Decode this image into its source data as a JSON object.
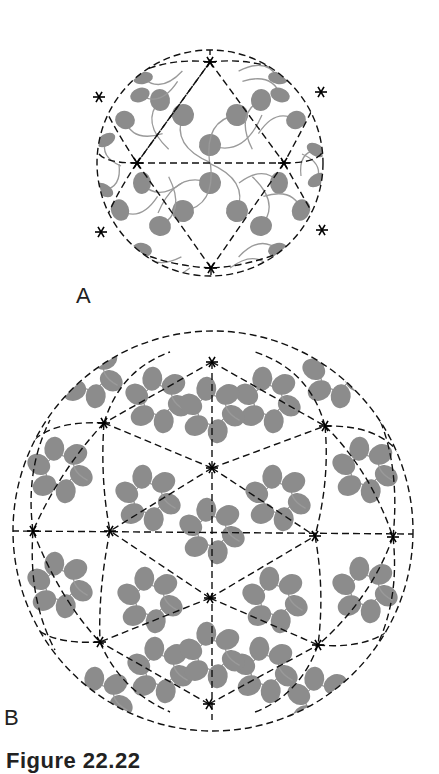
{
  "figure": {
    "panels": [
      {
        "label": "A",
        "description": "Icosahedral sphere (small) with dashed triangular lattice, vertices marked by black stars, gray subunits with curved tails",
        "center": [
          210,
          163
        ],
        "radius": 113
      },
      {
        "label": "B",
        "description": "Larger icosahedral sphere with denser triangular lattice, vertices marked by black stars, gray subunits with curved tails",
        "center": [
          213,
          531
        ],
        "radius": 200
      }
    ],
    "caption": "Figure 22.22",
    "colors": {
      "subunit": "#8c8c8c",
      "tail": "#9a9a9a",
      "lattice": "#111111",
      "background": "#ffffff"
    }
  }
}
